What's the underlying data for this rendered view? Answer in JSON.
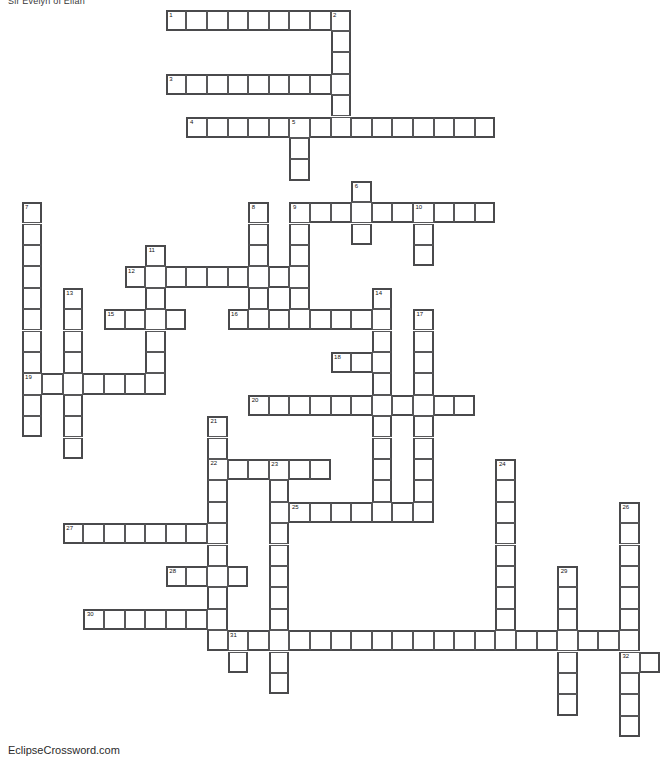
{
  "page": {
    "title": "Sir Evelyn of Eilan",
    "footer_credit": "EclipseCrossword.com",
    "background_color": "#ffffff",
    "grid_line_color": "#58585a",
    "grid_outline_color": "#4a4a4c"
  },
  "grid": {
    "cell_width": 20.6,
    "cell_height": 21.4,
    "origin_x": 1.0,
    "origin_y": 9.5,
    "columns": 33,
    "rows": 34,
    "numbered_clue_count": 32
  },
  "entries": [
    {
      "number": "1",
      "direction": "across",
      "col": 8,
      "row": 0,
      "length": 9
    },
    {
      "number": "2",
      "direction": "down",
      "col": 16,
      "row": 0,
      "length": 5
    },
    {
      "number": "3",
      "direction": "across",
      "col": 8,
      "row": 3,
      "length": 9
    },
    {
      "number": "4",
      "direction": "across",
      "col": 9,
      "row": 5,
      "length": 15
    },
    {
      "number": "5",
      "direction": "down",
      "col": 14,
      "row": 5,
      "length": 10
    },
    {
      "number": "6",
      "direction": "down",
      "col": 17,
      "row": 8,
      "length": 3
    },
    {
      "number": "7",
      "direction": "down",
      "col": 1,
      "row": 9,
      "length": 11
    },
    {
      "number": "8",
      "direction": "down",
      "col": 12,
      "row": 9,
      "length": 5
    },
    {
      "number": "9",
      "direction": "across",
      "col": 14,
      "row": 9,
      "length": 10
    },
    {
      "number": "10",
      "direction": "down",
      "col": 20,
      "row": 9,
      "length": 3
    },
    {
      "number": "11",
      "direction": "down",
      "col": 7,
      "row": 11,
      "length": 7
    },
    {
      "number": "12",
      "direction": "across",
      "col": 6,
      "row": 12,
      "length": 8
    },
    {
      "number": "13",
      "direction": "down",
      "col": 3,
      "row": 13,
      "length": 8
    },
    {
      "number": "14",
      "direction": "down",
      "col": 18,
      "row": 13,
      "length": 10
    },
    {
      "number": "15",
      "direction": "across",
      "col": 5,
      "row": 14,
      "length": 4
    },
    {
      "number": "16",
      "direction": "across",
      "col": 11,
      "row": 14,
      "length": 8
    },
    {
      "number": "17",
      "direction": "down",
      "col": 20,
      "row": 14,
      "length": 9
    },
    {
      "number": "18",
      "direction": "across",
      "col": 16,
      "row": 16,
      "length": 3
    },
    {
      "number": "19",
      "direction": "across",
      "col": 1,
      "row": 17,
      "length": 7
    },
    {
      "number": "20",
      "direction": "across",
      "col": 12,
      "row": 18,
      "length": 11
    },
    {
      "number": "21",
      "direction": "down",
      "col": 10,
      "row": 19,
      "length": 10
    },
    {
      "number": "22",
      "direction": "across",
      "col": 10,
      "row": 21,
      "length": 6
    },
    {
      "number": "23",
      "direction": "down",
      "col": 13,
      "row": 21,
      "length": 13
    },
    {
      "number": "24",
      "direction": "down",
      "col": 24,
      "row": 21,
      "length": 9
    },
    {
      "number": "25",
      "direction": "across",
      "col": 14,
      "row": 23,
      "length": 7
    },
    {
      "number": "26",
      "direction": "down",
      "col": 30,
      "row": 23,
      "length": 11
    },
    {
      "number": "27",
      "direction": "across",
      "col": 3,
      "row": 24,
      "length": 8
    },
    {
      "number": "28",
      "direction": "across",
      "col": 8,
      "row": 26,
      "length": 4
    },
    {
      "number": "29",
      "direction": "down",
      "col": 27,
      "row": 26,
      "length": 7
    },
    {
      "number": "30",
      "direction": "across",
      "col": 4,
      "row": 28,
      "length": 7
    },
    {
      "number": "31",
      "direction": "across",
      "col": 11,
      "row": 29,
      "length": 20
    },
    {
      "number": "32",
      "direction": "down",
      "col": 30,
      "row": 30,
      "length": 4
    }
  ],
  "cells": [
    {
      "c": 8,
      "r": 0,
      "n": "1"
    },
    {
      "c": 9,
      "r": 0
    },
    {
      "c": 10,
      "r": 0
    },
    {
      "c": 11,
      "r": 0
    },
    {
      "c": 12,
      "r": 0
    },
    {
      "c": 13,
      "r": 0
    },
    {
      "c": 14,
      "r": 0
    },
    {
      "c": 15,
      "r": 0
    },
    {
      "c": 16,
      "r": 0,
      "n": "2"
    },
    {
      "c": 16,
      "r": 1
    },
    {
      "c": 16,
      "r": 2
    },
    {
      "c": 8,
      "r": 3,
      "n": "3"
    },
    {
      "c": 9,
      "r": 3
    },
    {
      "c": 10,
      "r": 3
    },
    {
      "c": 11,
      "r": 3
    },
    {
      "c": 12,
      "r": 3
    },
    {
      "c": 13,
      "r": 3
    },
    {
      "c": 14,
      "r": 3
    },
    {
      "c": 15,
      "r": 3
    },
    {
      "c": 16,
      "r": 3
    },
    {
      "c": 16,
      "r": 4
    },
    {
      "c": 9,
      "r": 5,
      "n": "4"
    },
    {
      "c": 10,
      "r": 5
    },
    {
      "c": 11,
      "r": 5
    },
    {
      "c": 12,
      "r": 5
    },
    {
      "c": 13,
      "r": 5
    },
    {
      "c": 14,
      "r": 5,
      "n": "5"
    },
    {
      "c": 15,
      "r": 5
    },
    {
      "c": 16,
      "r": 5
    },
    {
      "c": 17,
      "r": 5
    },
    {
      "c": 18,
      "r": 5
    },
    {
      "c": 19,
      "r": 5
    },
    {
      "c": 20,
      "r": 5
    },
    {
      "c": 21,
      "r": 5
    },
    {
      "c": 22,
      "r": 5
    },
    {
      "c": 23,
      "r": 5
    },
    {
      "c": 14,
      "r": 6
    },
    {
      "c": 14,
      "r": 7
    },
    {
      "c": 17,
      "r": 8,
      "n": "6"
    },
    {
      "c": 1,
      "r": 9,
      "n": "7"
    },
    {
      "c": 12,
      "r": 9,
      "n": "8"
    },
    {
      "c": 14,
      "r": 9,
      "n": "9"
    },
    {
      "c": 15,
      "r": 9
    },
    {
      "c": 16,
      "r": 9
    },
    {
      "c": 17,
      "r": 9
    },
    {
      "c": 18,
      "r": 9
    },
    {
      "c": 19,
      "r": 9
    },
    {
      "c": 20,
      "r": 9,
      "n": "10"
    },
    {
      "c": 21,
      "r": 9
    },
    {
      "c": 22,
      "r": 9
    },
    {
      "c": 23,
      "r": 9
    },
    {
      "c": 1,
      "r": 10
    },
    {
      "c": 12,
      "r": 10
    },
    {
      "c": 14,
      "r": 10
    },
    {
      "c": 17,
      "r": 10
    },
    {
      "c": 20,
      "r": 10
    },
    {
      "c": 1,
      "r": 11
    },
    {
      "c": 7,
      "r": 11,
      "n": "11"
    },
    {
      "c": 12,
      "r": 11
    },
    {
      "c": 14,
      "r": 11
    },
    {
      "c": 20,
      "r": 11
    },
    {
      "c": 1,
      "r": 12
    },
    {
      "c": 6,
      "r": 12,
      "n": "12"
    },
    {
      "c": 7,
      "r": 12
    },
    {
      "c": 8,
      "r": 12
    },
    {
      "c": 9,
      "r": 12
    },
    {
      "c": 10,
      "r": 12
    },
    {
      "c": 11,
      "r": 12
    },
    {
      "c": 12,
      "r": 12
    },
    {
      "c": 13,
      "r": 12
    },
    {
      "c": 14,
      "r": 12
    },
    {
      "c": 1,
      "r": 13
    },
    {
      "c": 3,
      "r": 13,
      "n": "13"
    },
    {
      "c": 7,
      "r": 13
    },
    {
      "c": 12,
      "r": 13
    },
    {
      "c": 14,
      "r": 13
    },
    {
      "c": 18,
      "r": 13,
      "n": "14"
    },
    {
      "c": 1,
      "r": 14
    },
    {
      "c": 3,
      "r": 14
    },
    {
      "c": 5,
      "r": 14,
      "n": "15"
    },
    {
      "c": 6,
      "r": 14
    },
    {
      "c": 7,
      "r": 14
    },
    {
      "c": 8,
      "r": 14
    },
    {
      "c": 11,
      "r": 14,
      "n": "16"
    },
    {
      "c": 12,
      "r": 14
    },
    {
      "c": 13,
      "r": 14
    },
    {
      "c": 14,
      "r": 14
    },
    {
      "c": 15,
      "r": 14
    },
    {
      "c": 16,
      "r": 14
    },
    {
      "c": 17,
      "r": 14
    },
    {
      "c": 18,
      "r": 14
    },
    {
      "c": 20,
      "r": 14,
      "n": "17"
    },
    {
      "c": 1,
      "r": 15
    },
    {
      "c": 3,
      "r": 15
    },
    {
      "c": 7,
      "r": 15
    },
    {
      "c": 18,
      "r": 15
    },
    {
      "c": 20,
      "r": 15
    },
    {
      "c": 1,
      "r": 16
    },
    {
      "c": 3,
      "r": 16
    },
    {
      "c": 7,
      "r": 16
    },
    {
      "c": 16,
      "r": 16,
      "n": "18"
    },
    {
      "c": 17,
      "r": 16
    },
    {
      "c": 18,
      "r": 16
    },
    {
      "c": 20,
      "r": 16
    },
    {
      "c": 1,
      "r": 17,
      "n": "19"
    },
    {
      "c": 2,
      "r": 17
    },
    {
      "c": 3,
      "r": 17
    },
    {
      "c": 4,
      "r": 17
    },
    {
      "c": 5,
      "r": 17
    },
    {
      "c": 6,
      "r": 17
    },
    {
      "c": 7,
      "r": 17
    },
    {
      "c": 18,
      "r": 17
    },
    {
      "c": 20,
      "r": 17
    },
    {
      "c": 1,
      "r": 18
    },
    {
      "c": 3,
      "r": 18
    },
    {
      "c": 12,
      "r": 18,
      "n": "20"
    },
    {
      "c": 13,
      "r": 18
    },
    {
      "c": 14,
      "r": 18
    },
    {
      "c": 15,
      "r": 18
    },
    {
      "c": 16,
      "r": 18
    },
    {
      "c": 17,
      "r": 18
    },
    {
      "c": 18,
      "r": 18
    },
    {
      "c": 19,
      "r": 18
    },
    {
      "c": 20,
      "r": 18
    },
    {
      "c": 21,
      "r": 18
    },
    {
      "c": 22,
      "r": 18
    },
    {
      "c": 1,
      "r": 19
    },
    {
      "c": 3,
      "r": 19
    },
    {
      "c": 10,
      "r": 19,
      "n": "21"
    },
    {
      "c": 18,
      "r": 19
    },
    {
      "c": 20,
      "r": 19
    },
    {
      "c": 3,
      "r": 20
    },
    {
      "c": 10,
      "r": 20
    },
    {
      "c": 18,
      "r": 20
    },
    {
      "c": 20,
      "r": 20
    },
    {
      "c": 10,
      "r": 21,
      "n": "22"
    },
    {
      "c": 11,
      "r": 21
    },
    {
      "c": 12,
      "r": 21
    },
    {
      "c": 13,
      "r": 21,
      "n": "23"
    },
    {
      "c": 14,
      "r": 21
    },
    {
      "c": 15,
      "r": 21
    },
    {
      "c": 18,
      "r": 21
    },
    {
      "c": 20,
      "r": 21
    },
    {
      "c": 24,
      "r": 21,
      "n": "24"
    },
    {
      "c": 10,
      "r": 22
    },
    {
      "c": 13,
      "r": 22
    },
    {
      "c": 18,
      "r": 22
    },
    {
      "c": 20,
      "r": 22
    },
    {
      "c": 24,
      "r": 22
    },
    {
      "c": 10,
      "r": 23
    },
    {
      "c": 13,
      "r": 23
    },
    {
      "c": 14,
      "r": 23,
      "n": "25"
    },
    {
      "c": 15,
      "r": 23
    },
    {
      "c": 16,
      "r": 23
    },
    {
      "c": 17,
      "r": 23
    },
    {
      "c": 18,
      "r": 23
    },
    {
      "c": 19,
      "r": 23
    },
    {
      "c": 20,
      "r": 23
    },
    {
      "c": 24,
      "r": 23
    },
    {
      "c": 30,
      "r": 23,
      "n": "26"
    },
    {
      "c": 3,
      "r": 24,
      "n": "27"
    },
    {
      "c": 4,
      "r": 24
    },
    {
      "c": 5,
      "r": 24
    },
    {
      "c": 6,
      "r": 24
    },
    {
      "c": 7,
      "r": 24
    },
    {
      "c": 8,
      "r": 24
    },
    {
      "c": 9,
      "r": 24
    },
    {
      "c": 10,
      "r": 24
    },
    {
      "c": 13,
      "r": 24
    },
    {
      "c": 24,
      "r": 24
    },
    {
      "c": 30,
      "r": 24
    },
    {
      "c": 10,
      "r": 25
    },
    {
      "c": 13,
      "r": 25
    },
    {
      "c": 24,
      "r": 25
    },
    {
      "c": 30,
      "r": 25
    },
    {
      "c": 8,
      "r": 26,
      "n": "28"
    },
    {
      "c": 9,
      "r": 26
    },
    {
      "c": 10,
      "r": 26
    },
    {
      "c": 11,
      "r": 26
    },
    {
      "c": 13,
      "r": 26
    },
    {
      "c": 24,
      "r": 26
    },
    {
      "c": 27,
      "r": 26,
      "n": "29"
    },
    {
      "c": 30,
      "r": 26
    },
    {
      "c": 10,
      "r": 27
    },
    {
      "c": 13,
      "r": 27
    },
    {
      "c": 24,
      "r": 27
    },
    {
      "c": 27,
      "r": 27
    },
    {
      "c": 30,
      "r": 27
    },
    {
      "c": 4,
      "r": 28,
      "n": "30"
    },
    {
      "c": 5,
      "r": 28
    },
    {
      "c": 6,
      "r": 28
    },
    {
      "c": 7,
      "r": 28
    },
    {
      "c": 8,
      "r": 28
    },
    {
      "c": 9,
      "r": 28
    },
    {
      "c": 10,
      "r": 28
    },
    {
      "c": 13,
      "r": 28
    },
    {
      "c": 24,
      "r": 28
    },
    {
      "c": 27,
      "r": 28
    },
    {
      "c": 30,
      "r": 28
    },
    {
      "c": 10,
      "r": 29
    },
    {
      "c": 11,
      "r": 29,
      "n": "31"
    },
    {
      "c": 12,
      "r": 29
    },
    {
      "c": 13,
      "r": 29
    },
    {
      "c": 14,
      "r": 29
    },
    {
      "c": 15,
      "r": 29
    },
    {
      "c": 16,
      "r": 29
    },
    {
      "c": 17,
      "r": 29
    },
    {
      "c": 18,
      "r": 29
    },
    {
      "c": 19,
      "r": 29
    },
    {
      "c": 20,
      "r": 29
    },
    {
      "c": 21,
      "r": 29
    },
    {
      "c": 22,
      "r": 29
    },
    {
      "c": 23,
      "r": 29
    },
    {
      "c": 24,
      "r": 29
    },
    {
      "c": 25,
      "r": 29
    },
    {
      "c": 26,
      "r": 29
    },
    {
      "c": 27,
      "r": 29
    },
    {
      "c": 28,
      "r": 29
    },
    {
      "c": 29,
      "r": 29
    },
    {
      "c": 30,
      "r": 29
    },
    {
      "c": 11,
      "r": 30
    },
    {
      "c": 13,
      "r": 30
    },
    {
      "c": 27,
      "r": 30
    },
    {
      "c": 30,
      "r": 30,
      "n": "32"
    },
    {
      "c": 31,
      "r": 30
    },
    {
      "c": 13,
      "r": 31
    },
    {
      "c": 27,
      "r": 31
    },
    {
      "c": 30,
      "r": 31
    },
    {
      "c": 27,
      "r": 32
    },
    {
      "c": 30,
      "r": 32
    },
    {
      "c": 30,
      "r": 33
    }
  ]
}
